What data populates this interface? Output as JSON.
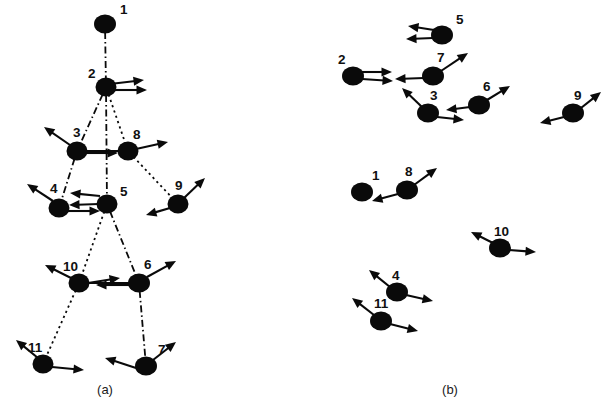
{
  "figure": {
    "background_color": "#ffffff",
    "ink_color": "#0a0a0a",
    "width": 611,
    "height": 410
  },
  "panels": [
    {
      "id": "a",
      "caption": "(a)",
      "caption_x": 105,
      "caption_y": 394,
      "description": "Connected stick-figure point-light walker with numbered joints and velocity vectors",
      "dots": [
        {
          "label": "1",
          "cx": 105,
          "cy": 24,
          "rx": 11,
          "ry": 9.5,
          "label_x": 120,
          "label_y": 14
        },
        {
          "label": "2",
          "cx": 106,
          "cy": 87,
          "rx": 10.5,
          "ry": 9.5,
          "label_x": 88,
          "label_y": 78
        },
        {
          "label": "3",
          "cx": 77,
          "cy": 151,
          "rx": 10.5,
          "ry": 9.5,
          "label_x": 73,
          "label_y": 137
        },
        {
          "label": "8",
          "cx": 128,
          "cy": 151,
          "rx": 10.5,
          "ry": 9.5,
          "label_x": 133,
          "label_y": 139
        },
        {
          "label": "4",
          "cx": 59,
          "cy": 208,
          "rx": 10.5,
          "ry": 9.5,
          "label_x": 50,
          "label_y": 193
        },
        {
          "label": "5",
          "cx": 107,
          "cy": 204,
          "rx": 10.5,
          "ry": 9.5,
          "label_x": 120,
          "label_y": 196
        },
        {
          "label": "9",
          "cx": 178,
          "cy": 204,
          "rx": 10.5,
          "ry": 9.5,
          "label_x": 175,
          "label_y": 190
        },
        {
          "label": "10",
          "cx": 79,
          "cy": 283,
          "rx": 10.5,
          "ry": 9.5,
          "label_x": 63,
          "label_y": 271
        },
        {
          "label": "6",
          "cx": 139,
          "cy": 283,
          "rx": 11,
          "ry": 9.5,
          "label_x": 144,
          "label_y": 269
        },
        {
          "label": "11",
          "cx": 43,
          "cy": 364,
          "rx": 10.5,
          "ry": 9.5,
          "label_x": 28,
          "label_y": 352
        },
        {
          "label": "7",
          "cx": 146,
          "cy": 366,
          "rx": 11,
          "ry": 9.5,
          "label_x": 158,
          "label_y": 354
        }
      ],
      "links": [
        {
          "from": "1",
          "to": "2",
          "style": "dashdot"
        },
        {
          "from": "2",
          "to": "3",
          "style": "dashdot"
        },
        {
          "from": "2",
          "to": "8",
          "style": "dotted"
        },
        {
          "from": "2",
          "to": "5",
          "style": "dashdot"
        },
        {
          "from": "3",
          "to": "8",
          "style": "solid"
        },
        {
          "from": "3",
          "to": "4",
          "style": "dashdot"
        },
        {
          "from": "8",
          "to": "9",
          "style": "dotted"
        },
        {
          "from": "5",
          "to": "10",
          "style": "dotted"
        },
        {
          "from": "5",
          "to": "6",
          "style": "dashdot"
        },
        {
          "from": "10",
          "to": "6",
          "style": "solid"
        },
        {
          "from": "10",
          "to": "11",
          "style": "dotted"
        },
        {
          "from": "6",
          "to": "7",
          "style": "dashdot"
        }
      ],
      "vectors": [
        {
          "joint": "2",
          "x1": 110,
          "y1": 84,
          "x2": 144,
          "y2": 80
        },
        {
          "joint": "2",
          "x1": 112,
          "y1": 90,
          "x2": 147,
          "y2": 90
        },
        {
          "joint": "3",
          "x1": 70,
          "y1": 145,
          "x2": 44,
          "y2": 127
        },
        {
          "joint": "3",
          "x1": 86,
          "y1": 153,
          "x2": 118,
          "y2": 153
        },
        {
          "joint": "8",
          "x1": 136,
          "y1": 149,
          "x2": 168,
          "y2": 142
        },
        {
          "joint": "4",
          "x1": 53,
          "y1": 201,
          "x2": 27,
          "y2": 184
        },
        {
          "joint": "4",
          "x1": 68,
          "y1": 211,
          "x2": 100,
          "y2": 211
        },
        {
          "joint": "5",
          "x1": 100,
          "y1": 196,
          "x2": 70,
          "y2": 193
        },
        {
          "joint": "5",
          "x1": 99,
          "y1": 204,
          "x2": 69,
          "y2": 205
        },
        {
          "joint": "9",
          "x1": 184,
          "y1": 198,
          "x2": 205,
          "y2": 178
        },
        {
          "joint": "9",
          "x1": 170,
          "y1": 208,
          "x2": 146,
          "y2": 215
        },
        {
          "joint": "10",
          "x1": 71,
          "y1": 278,
          "x2": 45,
          "y2": 265
        },
        {
          "joint": "10",
          "x1": 88,
          "y1": 283,
          "x2": 120,
          "y2": 278
        },
        {
          "joint": "6",
          "x1": 147,
          "y1": 277,
          "x2": 176,
          "y2": 261
        },
        {
          "joint": "6",
          "x1": 130,
          "y1": 285,
          "x2": 96,
          "y2": 285
        },
        {
          "joint": "11",
          "x1": 38,
          "y1": 358,
          "x2": 16,
          "y2": 340
        },
        {
          "joint": "11",
          "x1": 52,
          "y1": 367,
          "x2": 84,
          "y2": 370
        },
        {
          "joint": "7",
          "x1": 153,
          "y1": 360,
          "x2": 176,
          "y2": 342
        },
        {
          "joint": "7",
          "x1": 136,
          "y1": 368,
          "x2": 105,
          "y2": 358
        }
      ]
    },
    {
      "id": "b",
      "caption": "(b)",
      "caption_x": 450,
      "caption_y": 394,
      "description": "Unconnected point-light dots with the same numbered joints and velocity vectors",
      "dots": [
        {
          "label": "5",
          "cx": 442,
          "cy": 35,
          "rx": 11,
          "ry": 9.5,
          "label_x": 456,
          "label_y": 24
        },
        {
          "label": "2",
          "cx": 353,
          "cy": 76,
          "rx": 11,
          "ry": 9.5,
          "label_x": 338,
          "label_y": 64
        },
        {
          "label": "7",
          "cx": 433,
          "cy": 76,
          "rx": 11,
          "ry": 9.5,
          "label_x": 437,
          "label_y": 62
        },
        {
          "label": "3",
          "cx": 428,
          "cy": 113,
          "rx": 11,
          "ry": 9.5,
          "label_x": 430,
          "label_y": 100
        },
        {
          "label": "6",
          "cx": 479,
          "cy": 105,
          "rx": 11,
          "ry": 9.5,
          "label_x": 483,
          "label_y": 91
        },
        {
          "label": "9",
          "cx": 573,
          "cy": 113,
          "rx": 11,
          "ry": 9.5,
          "label_x": 574,
          "label_y": 100
        },
        {
          "label": "1",
          "cx": 362,
          "cy": 192,
          "rx": 11,
          "ry": 9.5,
          "label_x": 372,
          "label_y": 180
        },
        {
          "label": "8",
          "cx": 407,
          "cy": 190,
          "rx": 11,
          "ry": 9.5,
          "label_x": 405,
          "label_y": 176
        },
        {
          "label": "10",
          "cx": 500,
          "cy": 248,
          "rx": 11,
          "ry": 9.5,
          "label_x": 494,
          "label_y": 236
        },
        {
          "label": "4",
          "cx": 397,
          "cy": 292,
          "rx": 11,
          "ry": 9.5,
          "label_x": 392,
          "label_y": 280
        },
        {
          "label": "11",
          "cx": 381,
          "cy": 321,
          "rx": 11,
          "ry": 9.5,
          "label_x": 374,
          "label_y": 308
        }
      ],
      "links": [],
      "vectors": [
        {
          "joint": "5",
          "x1": 434,
          "y1": 30,
          "x2": 408,
          "y2": 26
        },
        {
          "joint": "5",
          "x1": 433,
          "y1": 38,
          "x2": 406,
          "y2": 39
        },
        {
          "joint": "2",
          "x1": 362,
          "y1": 72,
          "x2": 392,
          "y2": 72
        },
        {
          "joint": "2",
          "x1": 362,
          "y1": 79,
          "x2": 393,
          "y2": 81
        },
        {
          "joint": "7",
          "x1": 441,
          "y1": 71,
          "x2": 468,
          "y2": 53
        },
        {
          "joint": "7",
          "x1": 424,
          "y1": 78,
          "x2": 395,
          "y2": 79
        },
        {
          "joint": "3",
          "x1": 422,
          "y1": 107,
          "x2": 402,
          "y2": 88
        },
        {
          "joint": "3",
          "x1": 437,
          "y1": 117,
          "x2": 464,
          "y2": 120
        },
        {
          "joint": "6",
          "x1": 487,
          "y1": 100,
          "x2": 510,
          "y2": 86
        },
        {
          "joint": "6",
          "x1": 470,
          "y1": 107,
          "x2": 446,
          "y2": 110
        },
        {
          "joint": "9",
          "x1": 581,
          "y1": 108,
          "x2": 601,
          "y2": 92
        },
        {
          "joint": "9",
          "x1": 564,
          "y1": 117,
          "x2": 540,
          "y2": 123
        },
        {
          "joint": "8",
          "x1": 414,
          "y1": 185,
          "x2": 437,
          "y2": 168
        },
        {
          "joint": "8",
          "x1": 398,
          "y1": 194,
          "x2": 372,
          "y2": 201
        },
        {
          "joint": "10",
          "x1": 493,
          "y1": 243,
          "x2": 471,
          "y2": 232
        },
        {
          "joint": "10",
          "x1": 509,
          "y1": 250,
          "x2": 536,
          "y2": 252
        },
        {
          "joint": "4",
          "x1": 390,
          "y1": 287,
          "x2": 369,
          "y2": 270
        },
        {
          "joint": "4",
          "x1": 406,
          "y1": 295,
          "x2": 433,
          "y2": 301
        },
        {
          "joint": "11",
          "x1": 374,
          "y1": 315,
          "x2": 352,
          "y2": 298
        },
        {
          "joint": "11",
          "x1": 390,
          "y1": 324,
          "x2": 418,
          "y2": 331
        }
      ]
    }
  ]
}
